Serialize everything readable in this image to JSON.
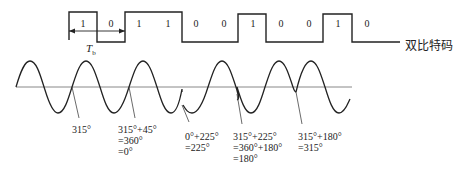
{
  "diagram": {
    "code_label": "双比特码",
    "period_label": "T",
    "period_subscript": "b",
    "bits": [
      "1",
      "0",
      "1",
      "1",
      "0",
      "0",
      "1",
      "0",
      "0",
      "1",
      "0"
    ],
    "waveform_levels": [
      "high",
      "low",
      "high",
      "high",
      "low",
      "low",
      "high",
      "low",
      "low",
      "high",
      "low"
    ],
    "phase_annotations": [
      {
        "lines": [
          "315°"
        ]
      },
      {
        "lines": [
          "315°+45°",
          "=360°",
          "=0°"
        ]
      },
      {
        "lines": [
          "0°+225°",
          "=225°"
        ]
      },
      {
        "lines": [
          "315°+225°",
          "=360°+180°",
          "=180°"
        ]
      },
      {
        "lines": [
          "315°+180°",
          "=315°"
        ]
      }
    ],
    "colors": {
      "line": "#222222",
      "axis": "#888888",
      "background": "#ffffff"
    }
  }
}
